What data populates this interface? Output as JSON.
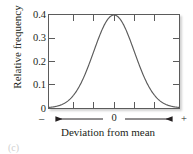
{
  "figure": {
    "caption": "(c)"
  },
  "chart_data": {
    "type": "line",
    "title": "",
    "subtitle": "",
    "xlabel": "Deviation from mean",
    "ylabel": "Relative frequency",
    "xlim": [
      -3.2,
      3.2
    ],
    "ylim": [
      0,
      0.4
    ],
    "grid": false,
    "legend": null,
    "y_ticks": [
      {
        "value": 0.4,
        "label": "0.4"
      },
      {
        "value": 0.3,
        "label": "0.3"
      },
      {
        "value": 0.2,
        "label": "0.2"
      },
      {
        "value": 0.1,
        "label": "0.1"
      },
      {
        "value": 0.0,
        "label": "0"
      }
    ],
    "x_ticks": [
      {
        "value": -2.0,
        "label": ""
      },
      {
        "value": -1.0,
        "label": ""
      },
      {
        "value": 0.0,
        "label": ""
      },
      {
        "value": 1.0,
        "label": ""
      },
      {
        "value": 2.0,
        "label": ""
      }
    ],
    "x_axis_annotation": {
      "left_sign": "–",
      "center_label": "0",
      "right_sign": "+",
      "arrow_style": "double-headed"
    },
    "series": [
      {
        "name": "normal distribution",
        "description": "standard normal probability density curve",
        "peak_x": 0,
        "peak_y": 0.4,
        "x": [
          -3.2,
          -3.0,
          -2.8,
          -2.6,
          -2.4,
          -2.2,
          -2.0,
          -1.8,
          -1.6,
          -1.4,
          -1.2,
          -1.0,
          -0.8,
          -0.6,
          -0.4,
          -0.2,
          0.0,
          0.2,
          0.4,
          0.6,
          0.8,
          1.0,
          1.2,
          1.4,
          1.6,
          1.8,
          2.0,
          2.2,
          2.4,
          2.6,
          2.8,
          3.0,
          3.2
        ],
        "y": [
          0.0024,
          0.0044,
          0.0079,
          0.0136,
          0.0224,
          0.0355,
          0.054,
          0.079,
          0.1109,
          0.1497,
          0.1942,
          0.242,
          0.2897,
          0.3332,
          0.3683,
          0.391,
          0.3989,
          0.391,
          0.3683,
          0.3332,
          0.2897,
          0.242,
          0.1942,
          0.1497,
          0.1109,
          0.079,
          0.054,
          0.0355,
          0.0224,
          0.0136,
          0.0079,
          0.0044,
          0.0024
        ]
      }
    ],
    "colors": {
      "curve": "#5b5b5b",
      "frame": "#5b5b5b",
      "text": "#231f20"
    }
  }
}
